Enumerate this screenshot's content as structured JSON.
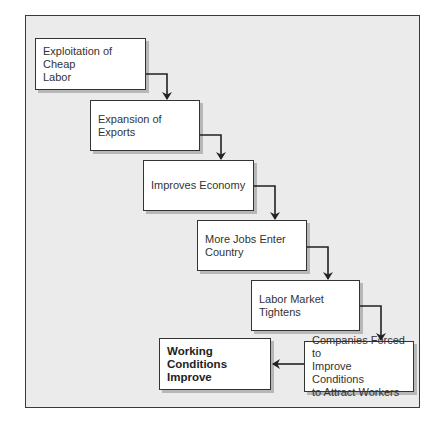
{
  "diagram": {
    "type": "flowchart",
    "direction": "staircase-down-right",
    "colors": {
      "frame_background": "#ebebeb",
      "frame_border": "#3a3a3a",
      "box_background": "#ffffff",
      "box_border": "#333333",
      "text": "#333333",
      "arrow": "#222222"
    },
    "nodes": [
      {
        "id": "n1",
        "label": "Exploitation of Cheap\nLabor",
        "bold": false
      },
      {
        "id": "n2",
        "label": "Expansion of\nExports",
        "bold": false
      },
      {
        "id": "n3",
        "label": "Improves Economy",
        "bold": false
      },
      {
        "id": "n4",
        "label": "More Jobs Enter\nCountry",
        "bold": false
      },
      {
        "id": "n5",
        "label": "Labor Market\nTightens",
        "bold": false
      },
      {
        "id": "n6",
        "label": "Companies Forced to\nImprove Conditions\nto Attract Workers",
        "bold": false
      },
      {
        "id": "n7",
        "label": "Working\nConditions\nImprove",
        "bold": true
      }
    ],
    "edges": [
      {
        "from": "n1",
        "to": "n2"
      },
      {
        "from": "n2",
        "to": "n3"
      },
      {
        "from": "n3",
        "to": "n4"
      },
      {
        "from": "n4",
        "to": "n5"
      },
      {
        "from": "n5",
        "to": "n6"
      },
      {
        "from": "n6",
        "to": "n7"
      }
    ]
  }
}
